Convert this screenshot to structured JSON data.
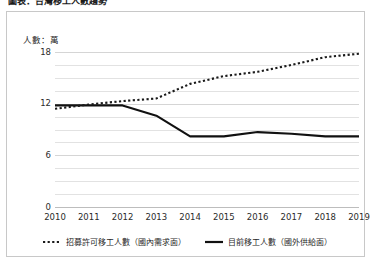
{
  "title_clipped": "圖表：台灣移工人數趨勢",
  "axis_unit": "人數：萬",
  "legend": {
    "demand": "招募許可移工人數（國內需求面）",
    "supply": "目前移工人數（國外供給面）"
  },
  "colors": {
    "demand_line": "#1a1a1a",
    "supply_line": "#111111",
    "gridline": "#e2e2e2",
    "frame_border": "#c8c8c8",
    "text": "#2b2b2b"
  },
  "chart_data": {
    "type": "line",
    "title": "",
    "xlabel": "",
    "ylabel": "人數：萬",
    "ylim": [
      0,
      18
    ],
    "yticks": [
      0,
      6,
      12,
      18
    ],
    "ytick_labels": [
      "0",
      "6",
      "12",
      "18"
    ],
    "minor_gridlines": true,
    "grid": true,
    "legend_position": "bottom",
    "categories": [
      "2010",
      "2011",
      "2012",
      "2013",
      "2014",
      "2015",
      "2016",
      "2017",
      "2018",
      "2019"
    ],
    "series": [
      {
        "name": "招募許可移工人數（國內需求面）",
        "style": "dotted",
        "values": [
          11.4,
          11.9,
          12.3,
          12.6,
          14.3,
          15.2,
          15.7,
          16.5,
          17.4,
          17.8
        ]
      },
      {
        "name": "目前移工人數（國外供給面）",
        "style": "solid",
        "values": [
          11.8,
          11.8,
          11.8,
          10.6,
          8.2,
          8.2,
          8.7,
          8.5,
          8.2,
          8.2
        ]
      }
    ]
  }
}
